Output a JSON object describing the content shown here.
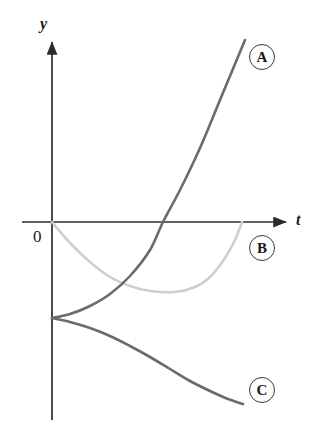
{
  "figure": {
    "background_color": "#ffffff",
    "width": 324,
    "height": 434
  },
  "axes": {
    "x_axis": {
      "label": "t",
      "name": "t-axis",
      "color": "#2b2b2b",
      "y_pixel": 222,
      "start_x": 22,
      "end_x": 290,
      "arrow": "right"
    },
    "y_axis": {
      "label": "y",
      "name": "y-axis",
      "color": "#2b2b2b",
      "x_pixel": 52,
      "start_y": 420,
      "end_y": 38,
      "arrow": "up"
    },
    "origin_label": "0"
  },
  "curve_tags": [
    {
      "id": "A",
      "label": "A",
      "cx": 262,
      "cy": 57
    },
    {
      "id": "B",
      "label": "B",
      "cx": 262,
      "cy": 248
    },
    {
      "id": "C",
      "label": "C",
      "cx": 262,
      "cy": 390
    }
  ],
  "chart_data": {
    "type": "line",
    "title": "",
    "xlabel": "t",
    "ylabel": "y",
    "grid": false,
    "legend_position": "right-inline-circled-labels",
    "axis_origin_label": "0",
    "xlim": [
      0,
      290
    ],
    "ylim": [
      -200,
      190
    ],
    "series": [
      {
        "name": "A",
        "label": "A",
        "color": "#6b6b6b",
        "line_width": 2.6,
        "shape": "increasing-convex",
        "starts_at_y_axis": true,
        "start_point": [
          52,
          318
        ],
        "end_point": [
          245,
          40
        ],
        "crosses_t_axis_at_x": 163,
        "points": [
          [
            52,
            318
          ],
          [
            70,
            314
          ],
          [
            90,
            306
          ],
          [
            110,
            294
          ],
          [
            130,
            276
          ],
          [
            150,
            250
          ],
          [
            163,
            222
          ],
          [
            180,
            190
          ],
          [
            200,
            148
          ],
          [
            220,
            100
          ],
          [
            235,
            64
          ],
          [
            245,
            40
          ]
        ]
      },
      {
        "name": "B",
        "label": "B",
        "color": "#cfcfcf",
        "line_width": 2.6,
        "shape": "parabola-concave-up",
        "starts_at_y_axis": true,
        "start_point": [
          52,
          222
        ],
        "end_point": [
          242,
          222
        ],
        "minimum_point": [
          175,
          292
        ],
        "points": [
          [
            52,
            222
          ],
          [
            70,
            243
          ],
          [
            90,
            262
          ],
          [
            110,
            277
          ],
          [
            130,
            286
          ],
          [
            150,
            291
          ],
          [
            175,
            292
          ],
          [
            195,
            287
          ],
          [
            210,
            277
          ],
          [
            225,
            258
          ],
          [
            235,
            240
          ],
          [
            242,
            222
          ]
        ]
      },
      {
        "name": "C",
        "label": "C",
        "color": "#6b6b6b",
        "line_width": 2.6,
        "shape": "decreasing-concave",
        "starts_at_y_axis": true,
        "start_point": [
          52,
          318
        ],
        "end_point": [
          243,
          404
        ],
        "points": [
          [
            52,
            318
          ],
          [
            70,
            322
          ],
          [
            90,
            328
          ],
          [
            110,
            336
          ],
          [
            130,
            346
          ],
          [
            150,
            357
          ],
          [
            170,
            369
          ],
          [
            190,
            381
          ],
          [
            210,
            391
          ],
          [
            228,
            399
          ],
          [
            243,
            404
          ]
        ]
      }
    ]
  }
}
